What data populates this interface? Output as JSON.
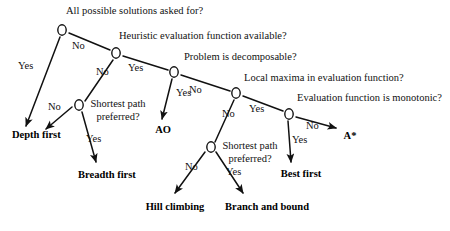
{
  "diagram": {
    "type": "decision-tree",
    "canvas": {
      "width": 450,
      "height": 231,
      "background": "#ffffff"
    },
    "style": {
      "line_color": "#111111",
      "node_fill": "#ffffff",
      "node_stroke": "#111111",
      "text_color": "#111111"
    },
    "nodes": [
      {
        "id": "n1",
        "label": "All possible solutions asked for?",
        "x": 62,
        "y": 30,
        "label_x": 66,
        "label_y": 5,
        "wrap_width": 0
      },
      {
        "id": "n2",
        "label": "Heuristic evaluation function available?",
        "x": 116,
        "y": 53,
        "label_x": 119,
        "label_y": 30,
        "wrap_width": 0
      },
      {
        "id": "n3",
        "label": "Problem is decomposable?",
        "x": 174,
        "y": 72,
        "label_x": 184,
        "label_y": 51,
        "wrap_width": 0
      },
      {
        "id": "n4",
        "label": "Local maxima in evaluation function?",
        "x": 236,
        "y": 93,
        "label_x": 244,
        "label_y": 72,
        "wrap_width": 0
      },
      {
        "id": "n5",
        "label": "Evaluation function is monotonic?",
        "x": 289,
        "y": 114,
        "label_x": 297,
        "label_y": 92,
        "wrap_width": 0
      },
      {
        "id": "n6",
        "label": "Shortest path preferred?",
        "x": 79,
        "y": 105,
        "label_x": 86,
        "label_y": 98,
        "wrap_width": 64
      },
      {
        "id": "n7",
        "label": "Shortest path preferred?",
        "x": 211,
        "y": 147,
        "label_x": 218,
        "label_y": 140,
        "wrap_width": 64
      }
    ],
    "leaves": [
      {
        "id": "l1",
        "label": "Depth first",
        "x": 12,
        "y": 129,
        "width": 42
      },
      {
        "id": "l2",
        "label": "Breadth first",
        "x": 78,
        "y": 169,
        "width": 50
      },
      {
        "id": "l3",
        "label": "AO",
        "x": 152,
        "y": 124,
        "width": 22
      },
      {
        "id": "l4",
        "label": "Hill climbing",
        "x": 142,
        "y": 201,
        "width": 66
      },
      {
        "id": "l5",
        "label": "Branch and bound",
        "x": 225,
        "y": 201,
        "width": 62
      },
      {
        "id": "l6",
        "label": "Best first",
        "x": 279,
        "y": 168,
        "width": 44
      },
      {
        "id": "l7",
        "label": "A*",
        "x": 341,
        "y": 130,
        "width": 18
      }
    ],
    "edges": [
      {
        "id": "e1",
        "from": "n1",
        "to": "l1",
        "answer": "Yes",
        "x1": 60,
        "y1": 37,
        "x2": 26,
        "y2": 126,
        "label_x": 18,
        "label_y": 60,
        "arrow": true
      },
      {
        "id": "e2",
        "from": "n1",
        "to": "n2",
        "answer": "No",
        "x1": 69,
        "y1": 33,
        "x2": 110,
        "y2": 50,
        "label_x": 72,
        "label_y": 40,
        "arrow": false
      },
      {
        "id": "e3",
        "from": "n2",
        "to": "n6",
        "answer": "No",
        "x1": 113,
        "y1": 60,
        "x2": 85,
        "y2": 101,
        "label_x": 96,
        "label_y": 66,
        "arrow": false
      },
      {
        "id": "e4",
        "from": "n2",
        "to": "n3",
        "answer": "Yes",
        "x1": 123,
        "y1": 56,
        "x2": 168,
        "y2": 70,
        "label_x": 128,
        "label_y": 62,
        "arrow": false
      },
      {
        "id": "e5",
        "from": "n6",
        "to": "l1",
        "answer": "No",
        "x1": 72,
        "y1": 107,
        "x2": 46,
        "y2": 129,
        "label_x": 48,
        "label_y": 101,
        "arrow": true
      },
      {
        "id": "e6",
        "from": "n6",
        "to": "l2",
        "answer": "Yes",
        "x1": 82,
        "y1": 112,
        "x2": 96,
        "y2": 162,
        "label_x": 86,
        "label_y": 133,
        "arrow": true
      },
      {
        "id": "e7",
        "from": "n3",
        "to": "l3",
        "answer": "Yes",
        "x1": 172,
        "y1": 79,
        "x2": 162,
        "y2": 119,
        "label_x": 176,
        "label_y": 87,
        "arrow": true
      },
      {
        "id": "e8",
        "from": "n3",
        "to": "n4",
        "answer": "No",
        "x1": 181,
        "y1": 75,
        "x2": 230,
        "y2": 91,
        "label_x": 189,
        "label_y": 84,
        "arrow": false
      },
      {
        "id": "e9",
        "from": "n4",
        "to": "n7",
        "answer": "No",
        "x1": 234,
        "y1": 100,
        "x2": 215,
        "y2": 142,
        "label_x": 222,
        "label_y": 108,
        "arrow": false
      },
      {
        "id": "e10",
        "from": "n4",
        "to": "n5",
        "answer": "Yes",
        "x1": 243,
        "y1": 96,
        "x2": 283,
        "y2": 111,
        "label_x": 249,
        "label_y": 103,
        "arrow": false
      },
      {
        "id": "e11",
        "from": "n7",
        "to": "l4",
        "answer": "No",
        "x1": 205,
        "y1": 152,
        "x2": 175,
        "y2": 193,
        "label_x": 185,
        "label_y": 161,
        "arrow": true
      },
      {
        "id": "e12",
        "from": "n7",
        "to": "l5",
        "answer": "Yes",
        "x1": 216,
        "y1": 152,
        "x2": 243,
        "y2": 193,
        "label_x": 226,
        "label_y": 166,
        "arrow": true
      },
      {
        "id": "e13",
        "from": "n5",
        "to": "l6",
        "answer": "Yes",
        "x1": 288,
        "y1": 121,
        "x2": 291,
        "y2": 162,
        "label_x": 292,
        "label_y": 134,
        "arrow": true
      },
      {
        "id": "e14",
        "from": "n5",
        "to": "l7",
        "answer": "No",
        "x1": 296,
        "y1": 117,
        "x2": 336,
        "y2": 128,
        "label_x": 306,
        "label_y": 120,
        "arrow": true
      }
    ]
  }
}
